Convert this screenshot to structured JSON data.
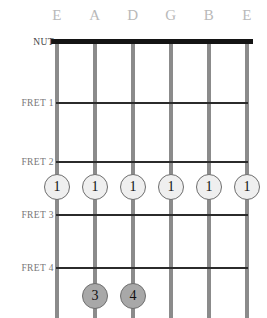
{
  "diagram": {
    "type": "guitar-chord-fretboard",
    "title_visible": false,
    "nut_label": "NUT",
    "strings": [
      {
        "name": "E",
        "x": 57
      },
      {
        "name": "A",
        "x": 95
      },
      {
        "name": "D",
        "x": 133
      },
      {
        "name": "G",
        "x": 171
      },
      {
        "name": "B",
        "x": 209
      },
      {
        "name": "E",
        "x": 247
      }
    ],
    "frets": [
      {
        "label": "FRET 1",
        "y": 102
      },
      {
        "label": "FRET 2",
        "y": 161
      },
      {
        "label": "FRET 3",
        "y": 214
      },
      {
        "label": "FRET 4",
        "y": 267
      }
    ],
    "nut_y": 41,
    "fingerings": [
      {
        "finger": "1",
        "string": "E",
        "x": 57,
        "y": 187,
        "shade": "light"
      },
      {
        "finger": "1",
        "string": "A",
        "x": 95,
        "y": 187,
        "shade": "light"
      },
      {
        "finger": "1",
        "string": "D",
        "x": 133,
        "y": 187,
        "shade": "light"
      },
      {
        "finger": "1",
        "string": "G",
        "x": 171,
        "y": 187,
        "shade": "light"
      },
      {
        "finger": "1",
        "string": "B",
        "x": 209,
        "y": 187,
        "shade": "light"
      },
      {
        "finger": "1",
        "string": "E",
        "x": 247,
        "y": 187,
        "shade": "light"
      },
      {
        "finger": "3",
        "string": "A",
        "x": 95,
        "y": 296,
        "shade": "dark"
      },
      {
        "finger": "4",
        "string": "D",
        "x": 133,
        "y": 296,
        "shade": "dark"
      }
    ],
    "colors": {
      "background": "#ffffff",
      "nut": "#141414",
      "fret": "#2b2b2b",
      "string": "#8b8b8b",
      "string_label": "#b9b9b9",
      "row_label": "#777777",
      "dot_light": "#efefef",
      "dot_dark": "#a8a8a8",
      "dot_border": "#6e6e6e"
    }
  }
}
